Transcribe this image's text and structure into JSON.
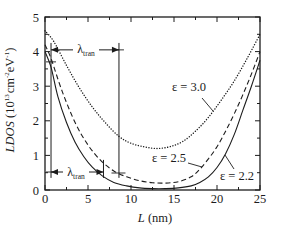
{
  "chart_data": {
    "type": "line",
    "title": "",
    "xlabel": "L (nm)",
    "ylabel": "LDOS (10^13 cm^-2 eV^-1)",
    "xlim": [
      0,
      25
    ],
    "ylim": [
      0,
      5
    ],
    "xticks": [
      0,
      5,
      10,
      15,
      20,
      25
    ],
    "yticks": [
      0,
      1,
      2,
      3,
      4,
      5
    ],
    "minor_xstep": 2.5,
    "minor_ystep": 0.5,
    "grid": false,
    "legend_position": "inline annotations",
    "series": [
      {
        "name": "ε = 2.2",
        "style": "solid",
        "x": [
          0,
          0.7,
          1.5,
          2.5,
          3.5,
          4.5,
          5.5,
          6.7,
          8,
          9.5,
          11,
          12.5,
          14,
          15.5,
          17,
          18,
          19,
          20,
          21,
          22,
          23,
          24,
          25
        ],
        "y": [
          4.0,
          3.55,
          2.7,
          1.95,
          1.38,
          0.97,
          0.66,
          0.4,
          0.22,
          0.12,
          0.06,
          0.04,
          0.04,
          0.06,
          0.12,
          0.22,
          0.38,
          0.65,
          1.05,
          1.6,
          2.3,
          3.0,
          3.75
        ]
      },
      {
        "name": "ε = 2.5",
        "style": "dashed",
        "x": [
          0,
          0.7,
          2,
          3.5,
          5,
          6.5,
          8,
          9.5,
          11,
          12.5,
          14,
          15.5,
          17,
          18,
          19,
          20,
          21,
          22,
          23,
          24,
          25
        ],
        "y": [
          4.2,
          3.8,
          2.85,
          1.95,
          1.3,
          0.85,
          0.55,
          0.38,
          0.27,
          0.21,
          0.2,
          0.24,
          0.38,
          0.6,
          0.9,
          1.25,
          1.7,
          2.2,
          2.75,
          3.35,
          4.0
        ]
      },
      {
        "name": "ε = 3.0",
        "style": "dotted",
        "x": [
          0,
          1,
          2.5,
          4,
          5.5,
          7,
          8.6,
          10,
          11.5,
          13,
          14.5,
          16,
          17.5,
          19,
          20.5,
          22,
          23.5,
          25
        ],
        "y": [
          4.6,
          4.3,
          3.6,
          2.95,
          2.4,
          1.95,
          1.55,
          1.35,
          1.25,
          1.2,
          1.25,
          1.4,
          1.7,
          2.1,
          2.6,
          3.15,
          3.8,
          4.5
        ]
      }
    ],
    "annotations": [
      {
        "type": "vline",
        "x": 0.7,
        "y0": 0.35,
        "y1": 4.25
      },
      {
        "type": "vline",
        "x": 8.6,
        "y0": 0.35,
        "y1": 4.25
      },
      {
        "type": "vline",
        "x": 6.8,
        "y0": 0.35,
        "y1": 0.87
      },
      {
        "type": "double_arrow",
        "label": "λ_tran",
        "y": 4.05,
        "x0": 0.7,
        "x1": 8.6
      },
      {
        "type": "double_arrow",
        "label": "λ_tran",
        "y": 0.52,
        "x0": 0.7,
        "x1": 6.8
      }
    ]
  },
  "labels": {
    "ylabel": {
      "main": "LDOS",
      "open": " (10",
      "exp1": "13",
      "unit1": "cm",
      "exp2": "-2",
      "unit2": "eV",
      "exp3": "-1",
      "close": ")"
    },
    "xlabel": {
      "var": "L",
      "unit": " (nm)"
    },
    "curves": {
      "eps30": "ε = 3.0",
      "eps25": "ε = 2.5",
      "eps22": "ε = 2.2"
    },
    "lambda_upper": {
      "symbol": "λ",
      "sub": "tran"
    },
    "lambda_lower": {
      "symbol": "λ",
      "sub": "tran"
    }
  },
  "style": {
    "ink": "#1c1c1c",
    "background": "#ffffff"
  }
}
